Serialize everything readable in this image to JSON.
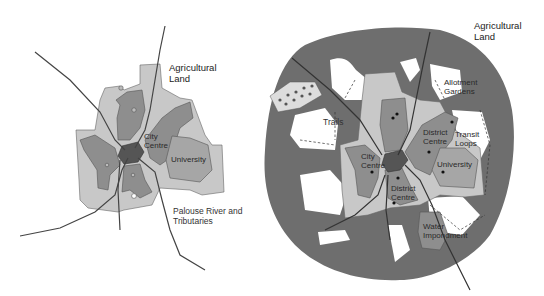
{
  "colors": {
    "background": "#ffffff",
    "agricultural_band": "#6e6e6e",
    "urban_light": "#c8c8c8",
    "urban_medium": "#8e8e8e",
    "university": "#a6a6a6",
    "city_centre_core": "#555555",
    "river": "#3a3a3a",
    "open_space": "#ffffff"
  },
  "left_map": {
    "labels": {
      "agricultural_land_1": "Agricultural",
      "agricultural_land_2": "Land",
      "city_centre_1": "City",
      "city_centre_2": "Centre",
      "university": "University",
      "river_1": "Palouse River and",
      "river_2": "Tributaries"
    }
  },
  "right_map": {
    "labels": {
      "agricultural_land_1": "Agricultural",
      "agricultural_land_2": "Land",
      "allotment_1": "Allotment",
      "allotment_2": "Gardens",
      "trails": "Trails",
      "district_centre_ne_1": "District",
      "district_centre_ne_2": "Centre",
      "transit_1": "Transit",
      "transit_2": "Loops",
      "city_centre_1": "City",
      "city_centre_2": "Centre",
      "university": "University",
      "district_centre_s_1": "District",
      "district_centre_s_2": "Centre",
      "water_1": "Water",
      "water_2": "Impondment"
    }
  }
}
